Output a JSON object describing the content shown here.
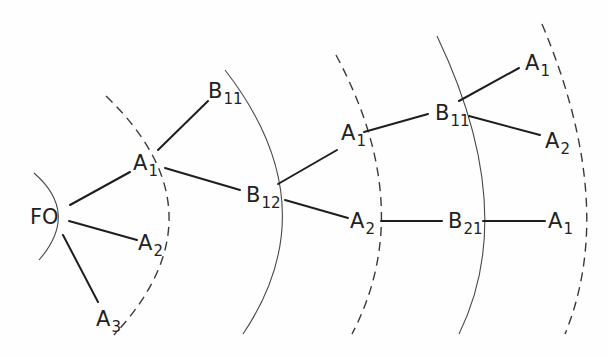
{
  "diagram": {
    "type": "tree-with-concentric-arcs",
    "root": {
      "id": "FO",
      "label": "FO",
      "sub": ""
    },
    "nodes": [
      {
        "id": "n_fo",
        "label": "FO",
        "sub": "",
        "x": 30,
        "y": 224
      },
      {
        "id": "n_a1a",
        "label": "A",
        "sub": "1",
        "x": 133,
        "y": 170
      },
      {
        "id": "n_b11a",
        "label": "B",
        "sub": "11",
        "x": 208,
        "y": 98
      },
      {
        "id": "n_a2a",
        "label": "A",
        "sub": "2",
        "x": 138,
        "y": 250
      },
      {
        "id": "n_a3",
        "label": "A",
        "sub": "3",
        "x": 96,
        "y": 326
      },
      {
        "id": "n_b12",
        "label": "B",
        "sub": "12",
        "x": 246,
        "y": 202
      },
      {
        "id": "n_a1b",
        "label": "A",
        "sub": "1",
        "x": 341,
        "y": 140
      },
      {
        "id": "n_a2b",
        "label": "A",
        "sub": "2",
        "x": 350,
        "y": 228
      },
      {
        "id": "n_b11b",
        "label": "B",
        "sub": "11",
        "x": 435,
        "y": 120
      },
      {
        "id": "n_b21",
        "label": "B",
        "sub": "21",
        "x": 448,
        "y": 228
      },
      {
        "id": "n_a1c",
        "label": "A",
        "sub": "1",
        "x": 525,
        "y": 70
      },
      {
        "id": "n_a2c",
        "label": "A",
        "sub": "2",
        "x": 545,
        "y": 148
      },
      {
        "id": "n_a1d",
        "label": "A",
        "sub": "1",
        "x": 548,
        "y": 228
      }
    ],
    "edges": [
      {
        "from": "FO",
        "to": "A1",
        "x1": 70,
        "y1": 205,
        "x2": 130,
        "y2": 172
      },
      {
        "from": "FO",
        "to": "A2",
        "x1": 69,
        "y1": 221,
        "x2": 137,
        "y2": 240
      },
      {
        "from": "FO",
        "to": "A3",
        "x1": 63,
        "y1": 235,
        "x2": 98,
        "y2": 302
      },
      {
        "from": "A1",
        "to": "B11",
        "x1": 158,
        "y1": 150,
        "x2": 208,
        "y2": 101
      },
      {
        "from": "A1",
        "to": "B12",
        "x1": 165,
        "y1": 168,
        "x2": 240,
        "y2": 190
      },
      {
        "from": "B12",
        "to": "A1",
        "x1": 278,
        "y1": 184,
        "x2": 337,
        "y2": 150
      },
      {
        "from": "B12",
        "to": "A2",
        "x1": 285,
        "y1": 200,
        "x2": 348,
        "y2": 218
      },
      {
        "from": "A1",
        "to": "B11",
        "x1": 364,
        "y1": 132,
        "x2": 428,
        "y2": 114
      },
      {
        "from": "A2",
        "to": "B21",
        "x1": 381,
        "y1": 221,
        "x2": 442,
        "y2": 221
      },
      {
        "from": "B11",
        "to": "A1",
        "x1": 459,
        "y1": 101,
        "x2": 519,
        "y2": 68
      },
      {
        "from": "B11",
        "to": "A2",
        "x1": 469,
        "y1": 116,
        "x2": 540,
        "y2": 135
      },
      {
        "from": "B21",
        "to": "A1",
        "x1": 483,
        "y1": 221,
        "x2": 545,
        "y2": 221
      }
    ],
    "arcs": [
      {
        "name": "arc-0-root",
        "style": "solid",
        "d": "M 34 173 Q 80 213 39 260"
      },
      {
        "name": "arc-1",
        "style": "dashed",
        "d": "M 106 96 Q 228 213 114 335"
      },
      {
        "name": "arc-2",
        "style": "solid",
        "d": "M 225 70 Q 330 205 243 334"
      },
      {
        "name": "arc-3",
        "style": "dashed",
        "d": "M 336 55 Q 418 208 352 334"
      },
      {
        "name": "arc-4",
        "style": "solid",
        "d": "M 437 36 Q 520 210 459 334"
      },
      {
        "name": "arc-5",
        "style": "dashed",
        "d": "M 542 24 Q 618 205 565 334"
      }
    ],
    "colors": {
      "edge": "#1e1e1e",
      "arc": "#4a4a4a",
      "text": "#222222",
      "background": "#fefefe"
    }
  }
}
